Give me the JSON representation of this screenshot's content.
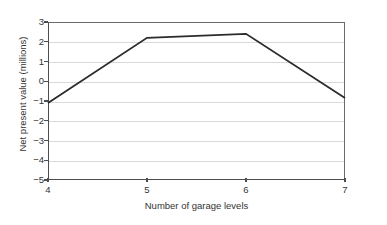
{
  "chart_data": {
    "type": "line",
    "title": "",
    "xlabel": "Number of garage levels",
    "ylabel": "Net present value (millions)",
    "x": [
      4,
      5,
      6,
      7
    ],
    "values": [
      -1.1,
      2.2,
      2.4,
      -0.85
    ],
    "series": [
      {
        "name": "Net present value",
        "x": [
          4,
          5,
          6,
          7
        ],
        "values": [
          -1.1,
          2.2,
          2.4,
          -0.85
        ]
      }
    ],
    "xlim": [
      4,
      7
    ],
    "ylim": [
      -5,
      3
    ],
    "xticks": [
      "4",
      "5",
      "6",
      "7"
    ],
    "xtick_values": [
      4,
      5,
      6,
      7
    ],
    "yticks": [
      "3",
      "2",
      "1",
      "0",
      "−1",
      "−2",
      "−3",
      "−4",
      "−5"
    ],
    "ytick_values": [
      3,
      2,
      1,
      0,
      -1,
      -2,
      -3,
      -4,
      -5
    ],
    "grid": "horizontal",
    "legend": "none",
    "colors": {
      "line": "#2b2b2b",
      "grid": "#d9d9d9",
      "axis": "#4d4d4d",
      "frame": "#6b6b6b",
      "text": "#333333",
      "background": "#ffffff"
    }
  }
}
